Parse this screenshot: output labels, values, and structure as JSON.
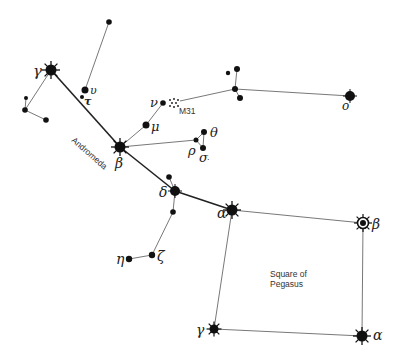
{
  "diagram": {
    "labels": {
      "constellation": "Andromeda",
      "asterism_line1": "Square of",
      "asterism_line2": "Pegasus",
      "galaxy": "M31"
    },
    "stars": [
      {
        "id": "and-gamma",
        "label": "γ",
        "x": 51,
        "y": 70,
        "type": "bright"
      },
      {
        "id": "and-beta",
        "label": "β",
        "x": 120,
        "y": 147,
        "type": "bright"
      },
      {
        "id": "and-delta",
        "label": "δ",
        "x": 175,
        "y": 191,
        "type": "medium"
      },
      {
        "id": "peg-alpha-alpheratz",
        "label": "α",
        "x": 232,
        "y": 210,
        "type": "bright"
      },
      {
        "id": "peg-beta",
        "label": "β",
        "x": 363,
        "y": 223,
        "type": "variable"
      },
      {
        "id": "peg-gamma",
        "label": "γ",
        "x": 214,
        "y": 329,
        "type": "bright-small"
      },
      {
        "id": "peg-alpha-markab",
        "label": "α",
        "x": 362,
        "y": 336,
        "type": "bright"
      },
      {
        "id": "and-mu",
        "label": "μ",
        "x": 146,
        "y": 125,
        "type": "dot"
      },
      {
        "id": "and-nu",
        "label": "ν",
        "x": 163,
        "y": 103,
        "type": "dot-small"
      },
      {
        "id": "and-upsilon",
        "label": "υ",
        "x": 85,
        "y": 90,
        "type": "dot"
      },
      {
        "id": "and-tau",
        "label": "τ",
        "x": 82,
        "y": 97,
        "type": "dot-small"
      },
      {
        "id": "and-rho",
        "label": "ρ",
        "x": 196,
        "y": 140,
        "type": "dot-small"
      },
      {
        "id": "and-theta",
        "label": "θ",
        "x": 204,
        "y": 132,
        "type": "dot"
      },
      {
        "id": "and-sigma",
        "label": "σ",
        "x": 203,
        "y": 148,
        "type": "dot"
      },
      {
        "id": "and-zeta",
        "label": "ζ",
        "x": 152,
        "y": 255,
        "type": "dot"
      },
      {
        "id": "and-eta",
        "label": "η",
        "x": 129,
        "y": 259,
        "type": "dot"
      },
      {
        "id": "and-omicron",
        "label": "o",
        "x": 350,
        "y": 96,
        "type": "medium"
      },
      {
        "id": "top-star",
        "label": "",
        "x": 109,
        "y": 22,
        "type": "dot"
      },
      {
        "id": "left-a",
        "label": "",
        "x": 26,
        "y": 98,
        "type": "dot-small"
      },
      {
        "id": "left-b",
        "label": "",
        "x": 25,
        "y": 110,
        "type": "dot"
      },
      {
        "id": "left-c",
        "label": "",
        "x": 46,
        "y": 120,
        "type": "dot"
      },
      {
        "id": "delta-above",
        "label": "",
        "x": 169,
        "y": 177,
        "type": "dot"
      },
      {
        "id": "delta-below",
        "label": "",
        "x": 173,
        "y": 212,
        "type": "dot"
      },
      {
        "id": "grp-a",
        "label": "",
        "x": 237,
        "y": 69,
        "type": "dot"
      },
      {
        "id": "grp-b",
        "label": "",
        "x": 228,
        "y": 73,
        "type": "dot-small"
      },
      {
        "id": "grp-c",
        "label": "",
        "x": 235,
        "y": 89,
        "type": "dot"
      },
      {
        "id": "grp-d",
        "label": "",
        "x": 240,
        "y": 98,
        "type": "dot"
      }
    ]
  }
}
